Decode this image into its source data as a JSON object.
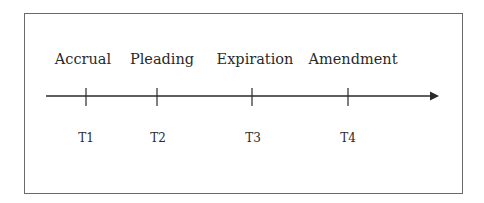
{
  "diagram": {
    "type": "timeline",
    "events": [
      {
        "label": "Accrual",
        "time": "T1",
        "x": 86
      },
      {
        "label": "Pleading",
        "time": "T2",
        "x": 157
      },
      {
        "label": "Expiration",
        "time": "T3",
        "x": 252
      },
      {
        "label": "Amendment",
        "time": "T4",
        "x": 348
      }
    ],
    "colors": {
      "line": "#2a2a2a",
      "frame": "#6a6a6a",
      "background": "#ffffff"
    }
  }
}
